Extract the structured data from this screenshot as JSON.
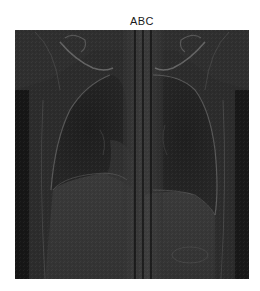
{
  "figure": {
    "title": "ABC",
    "image": {
      "description": "coronal chest radiograph (grayscale)",
      "colormap": "gray",
      "axes_visible": false
    },
    "overlay_lines": {
      "orientation": "vertical",
      "color": "#000000",
      "count": 3,
      "x_positions_px": [
        135,
        143,
        151
      ]
    }
  },
  "colors": {
    "background": "#ffffff",
    "image_base": "#2a2a2a",
    "line": "#000000",
    "title_text": "#1a1a1a"
  }
}
